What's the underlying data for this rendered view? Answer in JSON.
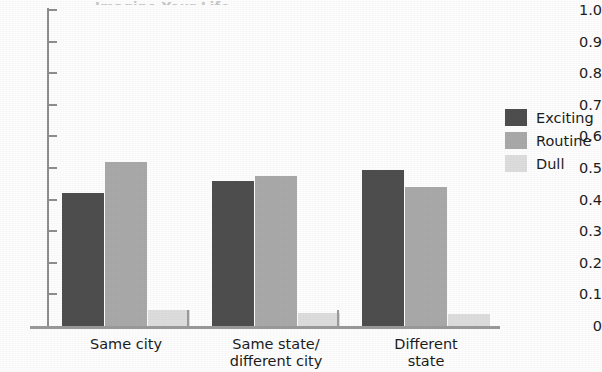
{
  "chart_data": {
    "type": "bar",
    "title": "",
    "title_remnant": "Imagine Your Life",
    "xlabel": "",
    "ylabel": "",
    "categories": [
      "Same city",
      "Same state/\ndifferent city",
      "Different\nstate"
    ],
    "series": [
      {
        "name": "Exciting",
        "color": "#4e4e4e",
        "values": [
          0.42,
          0.46,
          0.495
        ]
      },
      {
        "name": "Routine",
        "color": "#a9a9a9",
        "values": [
          0.52,
          0.475,
          0.44
        ]
      },
      {
        "name": "Dull",
        "color": "#dddddd",
        "values": [
          0.05,
          0.042,
          0.038
        ]
      }
    ],
    "ylim": [
      0,
      1.0
    ],
    "y_tick_values": [
      1.0,
      0.9,
      0.8,
      0.7,
      0.6,
      0.5,
      0.4,
      0.3,
      0.2,
      0.1,
      0
    ],
    "y_tick_labels": [
      "1.0",
      "0.9",
      "0.8",
      "0.7",
      "0.6",
      "0.5",
      "0.4",
      "0.3",
      "0.2",
      "0.1",
      "0"
    ],
    "grid": false,
    "legend_position": "right"
  },
  "legend": {
    "entries": [
      {
        "label": "Exciting"
      },
      {
        "label": "Routine"
      },
      {
        "label": "Dull"
      }
    ]
  }
}
